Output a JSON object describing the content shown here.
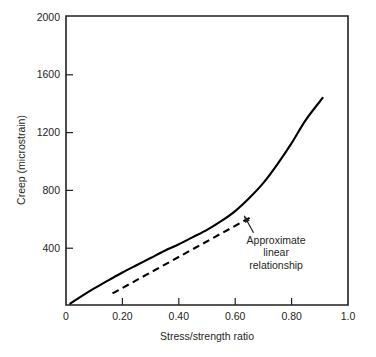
{
  "chart_data": {
    "type": "line",
    "title": "",
    "xlabel": "Stress/strength ratio",
    "ylabel": "Creep (microstrain)",
    "xlim": [
      0,
      1.0
    ],
    "ylim": [
      0,
      2000
    ],
    "grid": false,
    "legend": "none",
    "xticks": [
      {
        "value": 0,
        "label": "0"
      },
      {
        "value": 0.2,
        "label": "0.20"
      },
      {
        "value": 0.4,
        "label": "0.40"
      },
      {
        "value": 0.6,
        "label": "0.60"
      },
      {
        "value": 0.8,
        "label": "0.80"
      },
      {
        "value": 1.0,
        "label": "1.0"
      }
    ],
    "yticks": [
      {
        "value": 0,
        "label": "0"
      },
      {
        "value": 400,
        "label": "400"
      },
      {
        "value": 800,
        "label": "800"
      },
      {
        "value": 1200,
        "label": "1200"
      },
      {
        "value": 1600,
        "label": "1600"
      },
      {
        "value": 2000,
        "label": "2000"
      }
    ],
    "series": [
      {
        "name": "creep-curve",
        "style": "solid",
        "color": "#000000",
        "x": [
          0.015,
          0.05,
          0.1,
          0.15,
          0.2,
          0.25,
          0.3,
          0.35,
          0.4,
          0.45,
          0.5,
          0.55,
          0.6,
          0.65,
          0.7,
          0.75,
          0.8,
          0.85,
          0.91
        ],
        "y": [
          10,
          55,
          115,
          170,
          225,
          275,
          325,
          375,
          420,
          470,
          520,
          580,
          650,
          740,
          845,
          975,
          1120,
          1280,
          1433
        ]
      },
      {
        "name": "approximate-linear-relationship",
        "style": "dashed",
        "color": "#000000",
        "x": [
          0.165,
          0.665
        ],
        "y": [
          80,
          618
        ]
      }
    ],
    "annotations": [
      {
        "name": "approximate-linear-relationship-note",
        "lines": [
          "Approximate",
          "linear",
          "relationship"
        ],
        "text_x": 0.745,
        "text_y": 425,
        "arrow_tip_x": 0.632,
        "arrow_tip_y": 618,
        "arrow_tail_x": 0.665,
        "arrow_tail_y": 500
      }
    ]
  }
}
